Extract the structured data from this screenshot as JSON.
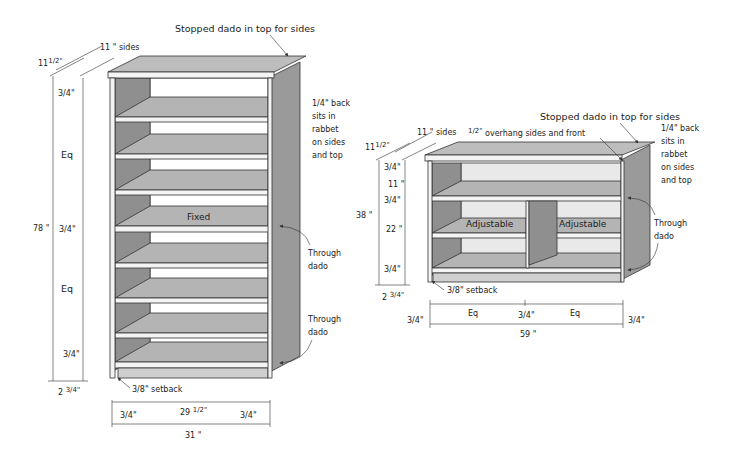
{
  "colors": {
    "panel_dark": "#8f8f8f",
    "panel_mid": "#b4b4b4",
    "panel_light": "#cfcfcf",
    "edge_white": "#f4f4f4",
    "side_panel": "#9a9a9a",
    "top_panel": "#bdbdbd",
    "line": "#333333"
  },
  "tall_bookcase": {
    "callouts": {
      "stopped_dado": "Stopped dado in top for sides",
      "back_line1": "back",
      "back_frac": "1/4\"",
      "back_line2": "sits in",
      "back_line3": "rabbet",
      "back_line4": "on sides",
      "back_line5": "and top",
      "through_dado_1_line1": "Through",
      "through_dado_1_line2": "dado",
      "through_dado_2_line1": "Through",
      "through_dado_2_line2": "dado",
      "setback": "setback",
      "setback_frac": "3/8\""
    },
    "shelf_labels": {
      "fixed": "Fixed"
    },
    "dimensions": {
      "sides_depth": "11 \" sides",
      "top_depth_whole": "11",
      "top_depth_frac": "1/2\"",
      "top_thickness": "3/4\"",
      "upper_space": "Eq",
      "fixed_thickness": "3/4\"",
      "lower_space": "Eq",
      "bottom_thickness": "3/4\"",
      "overall_height": "78 \"",
      "toe_kick_whole": "2",
      "toe_kick_frac": "3/4\"",
      "left_side": "3/4\"",
      "inner_width_whole": "29",
      "inner_width_frac": "1/2\"",
      "right_side": "3/4\"",
      "overall_width": "31 \""
    }
  },
  "low_bookcase": {
    "callouts": {
      "stopped_dado": "Stopped dado in top for sides",
      "overhang": "overhang sides and front",
      "overhang_frac": "1/2\"",
      "back_frac": "1/4\"",
      "back_line1": "back",
      "back_line2": "sits in",
      "back_line3": "rabbet",
      "back_line4": "on sides",
      "back_line5": "and top",
      "through_dado_line1": "Through",
      "through_dado_line2": "dado",
      "setback": "setback",
      "setback_frac": "3/8\""
    },
    "shelf_labels": {
      "left": "Adjustable",
      "right": "Adjustable"
    },
    "dimensions": {
      "sides_depth": "11 \" sides",
      "top_depth_whole": "11",
      "top_depth_frac": "1/2\"",
      "top_thickness": "3/4\"",
      "upper_space": "11 \"",
      "middle_thickness": "3/4\"",
      "lower_space": "22 \"",
      "bottom_thickness": "3/4\"",
      "overall_height": "38 \"",
      "toe_kick_whole": "2",
      "toe_kick_frac": "3/4\"",
      "left_side": "3/4\"",
      "left_bay": "Eq",
      "divider": "3/4\"",
      "right_bay": "Eq",
      "right_side": "3/4\"",
      "overall_width": "59 \""
    }
  }
}
